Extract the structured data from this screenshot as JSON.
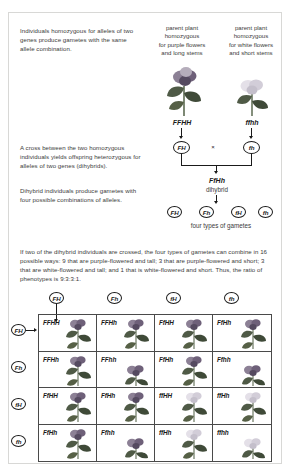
{
  "annotations": {
    "note1": "Individuals homozygous for alleles of two genes produce gametes with the same allele combination.",
    "note2": "A cross between the two homozygous individuals yields offspring heterozygous for alleles of two genes (dihybrids).",
    "note3": "Dihybrid individuals produce gametes with four possible combinations of alleles.",
    "note4": "If two of the dihybrid individuals are crossed, the four types of gametes can combine in 16 possible ways: 9 that are purple-flowered and tall; 3 that are purple-flowered and short; 3 that are white-flowered and tall; and 1 that is white-flowered and short. Thus, the ratio of phenotypes is 9:3:3:1."
  },
  "parents": {
    "left": {
      "caption": "parent plant\nhomozygous\nfor purple flowers\nand long stems",
      "caption_lines": [
        "parent plant",
        "homozygous",
        "for purple flowers",
        "and long stems"
      ],
      "genotype": "FFHH",
      "gamete": "FH",
      "flower_color": "#6b5b7a",
      "stem": "long"
    },
    "right": {
      "caption_lines": [
        "parent plant",
        "homozygous",
        "for white flowers",
        "and short stems"
      ],
      "genotype": "ffhh",
      "gamete": "fh",
      "flower_color": "#d8d4dd",
      "stem": "short"
    },
    "cross_symbol": "×"
  },
  "offspring": {
    "genotype": "FfHh",
    "label": "dihybrid",
    "gametes": [
      "FH",
      "Fh",
      "fH",
      "fh"
    ],
    "gametes_caption": "four types of gametes"
  },
  "punnett": {
    "column_headers": [
      "FH",
      "Fh",
      "fH",
      "fh"
    ],
    "row_headers": [
      "FH",
      "Fh",
      "fH",
      "fh"
    ],
    "cells": [
      [
        {
          "genotype": "FFHH",
          "flower": "purple",
          "stem": "tall"
        },
        {
          "genotype": "FFHh",
          "flower": "purple",
          "stem": "tall"
        },
        {
          "genotype": "FfHH",
          "flower": "purple",
          "stem": "tall"
        },
        {
          "genotype": "FfHh",
          "flower": "purple",
          "stem": "tall"
        }
      ],
      [
        {
          "genotype": "FFHh",
          "flower": "purple",
          "stem": "tall"
        },
        {
          "genotype": "FFhh",
          "flower": "purple",
          "stem": "short"
        },
        {
          "genotype": "FfHh",
          "flower": "purple",
          "stem": "tall"
        },
        {
          "genotype": "Ffhh",
          "flower": "purple",
          "stem": "short"
        }
      ],
      [
        {
          "genotype": "FfHH",
          "flower": "purple",
          "stem": "tall"
        },
        {
          "genotype": "FfHh",
          "flower": "purple",
          "stem": "tall"
        },
        {
          "genotype": "ffHH",
          "flower": "white",
          "stem": "tall"
        },
        {
          "genotype": "ffHh",
          "flower": "white",
          "stem": "tall"
        }
      ],
      [
        {
          "genotype": "FfHh",
          "flower": "purple",
          "stem": "tall"
        },
        {
          "genotype": "Ffhh",
          "flower": "purple",
          "stem": "short"
        },
        {
          "genotype": "ffHh",
          "flower": "white",
          "stem": "tall"
        },
        {
          "genotype": "ffhh",
          "flower": "white",
          "stem": "short"
        }
      ]
    ],
    "phenotype_ratio": "9:3:3:1"
  },
  "colors": {
    "purple_flower": "#6e6079",
    "white_flower": "#dedae2",
    "leaf_dark": "#4a4a4a",
    "text": "#3b3b3b",
    "line": "#1a1a1a",
    "frame": "#d8d8d6"
  }
}
